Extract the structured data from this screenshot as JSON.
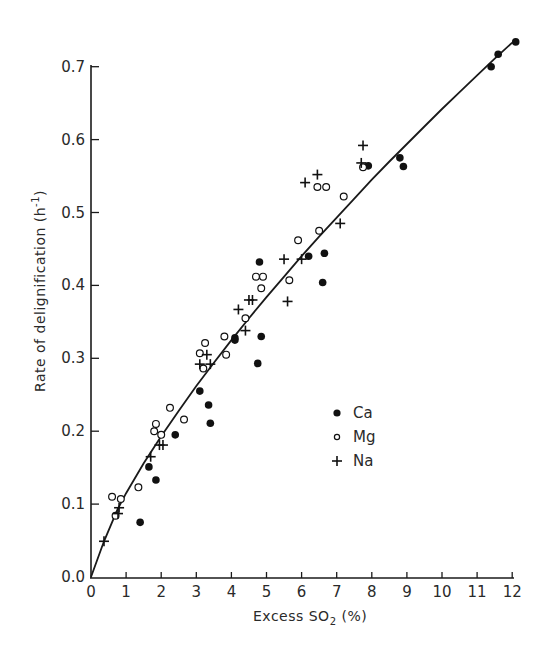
{
  "chart_data": {
    "type": "scatter",
    "title": "",
    "xlabel": "Excess SO2 (%)",
    "xlabel_main": "Excess SO",
    "xlabel_sub": "2",
    "xlabel_tail": " (%)",
    "ylabel": "Rate of delignification (h",
    "ylabel_sup": "-1",
    "ylabel_tail": ")",
    "xlim": [
      0,
      12
    ],
    "ylim": [
      0.0,
      0.7
    ],
    "x_ticks": [
      "0",
      "1",
      "2",
      "3",
      "4",
      "5",
      "6",
      "7",
      "8",
      "9",
      "10",
      "11",
      "12"
    ],
    "y_ticks": [
      "0.0",
      "0.1",
      "0.2",
      "0.3",
      "0.4",
      "0.5",
      "0.6",
      "0.7"
    ],
    "grid": false,
    "legend_position": "center-right, inside plot",
    "legend": [
      {
        "name": "Ca",
        "marker": "filled-circle"
      },
      {
        "name": "Mg",
        "marker": "open-circle"
      },
      {
        "name": "Na",
        "marker": "plus"
      }
    ],
    "series": [
      {
        "name": "Ca",
        "marker": "filled-circle",
        "points": [
          [
            1.4,
            0.075
          ],
          [
            1.65,
            0.151
          ],
          [
            1.85,
            0.133
          ],
          [
            2.4,
            0.195
          ],
          [
            3.1,
            0.255
          ],
          [
            3.35,
            0.236
          ],
          [
            3.4,
            0.211
          ],
          [
            4.1,
            0.328
          ],
          [
            4.1,
            0.325
          ],
          [
            4.75,
            0.293
          ],
          [
            4.85,
            0.33
          ],
          [
            4.8,
            0.432
          ],
          [
            6.2,
            0.44
          ],
          [
            6.65,
            0.444
          ],
          [
            6.6,
            0.404
          ],
          [
            7.9,
            0.564
          ],
          [
            8.8,
            0.575
          ],
          [
            8.9,
            0.563
          ],
          [
            11.4,
            0.7
          ],
          [
            11.6,
            0.717
          ],
          [
            12.1,
            0.734
          ]
        ]
      },
      {
        "name": "Mg",
        "marker": "open-circle",
        "points": [
          [
            0.6,
            0.11
          ],
          [
            0.7,
            0.084
          ],
          [
            0.85,
            0.107
          ],
          [
            1.35,
            0.123
          ],
          [
            1.8,
            0.2
          ],
          [
            1.85,
            0.21
          ],
          [
            2.0,
            0.195
          ],
          [
            2.25,
            0.232
          ],
          [
            2.65,
            0.216
          ],
          [
            3.1,
            0.307
          ],
          [
            3.2,
            0.286
          ],
          [
            3.25,
            0.321
          ],
          [
            3.8,
            0.33
          ],
          [
            3.85,
            0.305
          ],
          [
            4.4,
            0.355
          ],
          [
            4.7,
            0.412
          ],
          [
            4.85,
            0.396
          ],
          [
            4.9,
            0.412
          ],
          [
            5.65,
            0.407
          ],
          [
            5.9,
            0.462
          ],
          [
            6.45,
            0.535
          ],
          [
            6.5,
            0.475
          ],
          [
            6.7,
            0.535
          ],
          [
            7.2,
            0.522
          ],
          [
            7.75,
            0.562
          ]
        ]
      },
      {
        "name": "Na",
        "marker": "plus",
        "points": [
          [
            0.37,
            0.049
          ],
          [
            0.77,
            0.087
          ],
          [
            0.8,
            0.095
          ],
          [
            1.7,
            0.165
          ],
          [
            1.95,
            0.181
          ],
          [
            2.05,
            0.181
          ],
          [
            3.1,
            0.292
          ],
          [
            3.3,
            0.305
          ],
          [
            3.4,
            0.292
          ],
          [
            4.2,
            0.367
          ],
          [
            4.4,
            0.338
          ],
          [
            4.5,
            0.38
          ],
          [
            4.6,
            0.38
          ],
          [
            5.5,
            0.436
          ],
          [
            5.6,
            0.378
          ],
          [
            6.0,
            0.436
          ],
          [
            6.1,
            0.541
          ],
          [
            6.45,
            0.552
          ],
          [
            7.1,
            0.485
          ],
          [
            7.7,
            0.568
          ],
          [
            7.75,
            0.592
          ]
        ]
      }
    ],
    "fit_line": {
      "name": "fitted curve",
      "style": "solid",
      "points": [
        [
          0.0,
          0.0
        ],
        [
          0.37,
          0.049
        ],
        [
          0.75,
          0.092
        ],
        [
          1.0,
          0.115
        ],
        [
          1.5,
          0.156
        ],
        [
          2.0,
          0.193
        ],
        [
          2.5,
          0.228
        ],
        [
          3.0,
          0.262
        ],
        [
          3.5,
          0.294
        ],
        [
          4.0,
          0.325
        ],
        [
          4.5,
          0.355
        ],
        [
          5.0,
          0.384
        ],
        [
          5.5,
          0.412
        ],
        [
          6.0,
          0.44
        ],
        [
          6.5,
          0.467
        ],
        [
          7.0,
          0.493
        ],
        [
          7.5,
          0.519
        ],
        [
          8.0,
          0.545
        ],
        [
          8.5,
          0.57
        ],
        [
          9.0,
          0.594
        ],
        [
          9.5,
          0.618
        ],
        [
          10.0,
          0.642
        ],
        [
          10.5,
          0.665
        ],
        [
          11.0,
          0.688
        ],
        [
          11.5,
          0.711
        ],
        [
          12.0,
          0.733
        ]
      ]
    }
  },
  "plot_area": {
    "x0": 91,
    "y0": 577,
    "px_per_x": 35.1,
    "px_per_y": 729
  }
}
